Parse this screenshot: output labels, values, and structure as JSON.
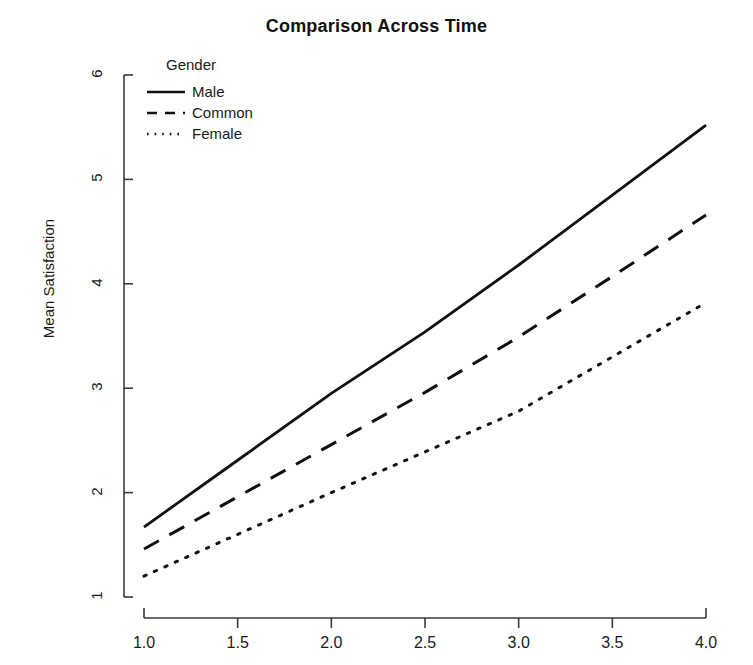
{
  "chart_data": {
    "type": "line",
    "title": "Comparison Across Time",
    "xlabel": "",
    "ylabel": "Mean Satisfaction",
    "xlim": [
      1.0,
      4.0
    ],
    "ylim": [
      1,
      6
    ],
    "grid": false,
    "legend_position": "top-left",
    "legend_title": "Gender",
    "xticks": [
      "1.0",
      "1.5",
      "2.0",
      "2.5",
      "3.0",
      "3.5",
      "4.0"
    ],
    "xtick_values": [
      1.0,
      1.5,
      2.0,
      2.5,
      3.0,
      3.5,
      4.0
    ],
    "yticks": [
      "1",
      "2",
      "3",
      "4",
      "5",
      "6"
    ],
    "ytick_values": [
      1,
      2,
      3,
      4,
      5,
      6
    ],
    "x": [
      1.0,
      1.5,
      2.0,
      2.5,
      3.0,
      3.5,
      4.0
    ],
    "series": [
      {
        "name": "Male",
        "linestyle": "solid",
        "color": "#111111",
        "values": [
          1.67,
          2.31,
          2.95,
          3.54,
          4.18,
          4.85,
          5.52
        ]
      },
      {
        "name": "Common",
        "linestyle": "dashed",
        "color": "#111111",
        "values": [
          1.46,
          1.96,
          2.46,
          2.96,
          3.49,
          4.07,
          4.66
        ]
      },
      {
        "name": "Female",
        "linestyle": "dotted",
        "color": "#111111",
        "values": [
          1.2,
          1.6,
          2.0,
          2.39,
          2.78,
          3.3,
          3.82
        ]
      }
    ]
  }
}
